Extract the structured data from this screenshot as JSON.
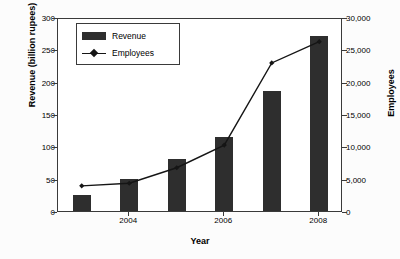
{
  "chart_data": {
    "type": "bar",
    "title": "",
    "xlabel": "Year",
    "ylabel": "Revenue (billion rupees)",
    "ylabel_right": "Employees",
    "categories": [
      "2003",
      "2004",
      "2005",
      "2006",
      "2007",
      "2008"
    ],
    "xtick_labels": [
      "2004",
      "2006",
      "2008"
    ],
    "ylim": [
      0,
      300
    ],
    "ylim_right": [
      0,
      30000
    ],
    "ytick_labels_left": [
      "0",
      "50",
      "100",
      "150",
      "200",
      "250",
      "300"
    ],
    "ytick_values_left": [
      0,
      50,
      100,
      150,
      200,
      250,
      300
    ],
    "ytick_labels_right": [
      "0",
      "5,000",
      "10,000",
      "15,000",
      "20,000",
      "25,000",
      "30,000"
    ],
    "ytick_values_right": [
      0,
      5000,
      10000,
      15000,
      20000,
      25000,
      30000
    ],
    "grid": false,
    "legend_position": "upper-left-inside",
    "series": [
      {
        "name": "Revenue",
        "kind": "bar",
        "axis": "left",
        "unit": "billion rupees",
        "color": "#2e2e2e",
        "values": [
          25,
          50,
          80,
          115,
          185,
          270
        ]
      },
      {
        "name": "Employees",
        "kind": "line",
        "axis": "right",
        "unit": "employees",
        "color": "#151515",
        "marker": "diamond",
        "values": [
          4200,
          4600,
          7000,
          10500,
          23200,
          26500
        ]
      }
    ]
  },
  "legend": {
    "items": [
      {
        "label": "Revenue",
        "type": "bar-swatch"
      },
      {
        "label": "Employees",
        "type": "line-swatch"
      }
    ]
  },
  "axis_titles": {
    "left": "Revenue (billion rupees)",
    "right": "Employees",
    "bottom": "Year"
  },
  "colors": {
    "bar_fill": "#2e2e2e",
    "line": "#151515",
    "axis": "#3a3a3a",
    "background": "#ffffff",
    "page_background": "#fcfcfc"
  }
}
